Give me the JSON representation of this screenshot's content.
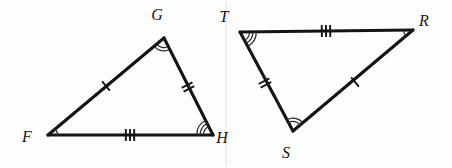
{
  "figure": {
    "kind": "congruent-triangles-diagram",
    "background_color": "#fdfdfd",
    "stroke_color": "#141414",
    "label_color": "#161616"
  },
  "triangles": [
    {
      "id": "triangle-fgh",
      "name": "FGH",
      "vertices": [
        {
          "id": "vertex-f",
          "label": "F",
          "x": 48,
          "y": 135,
          "label_x": 27,
          "label_y": 142,
          "angle_arcs": 1
        },
        {
          "id": "vertex-g",
          "label": "G",
          "x": 164,
          "y": 38,
          "label_x": 157,
          "label_y": 20,
          "angle_arcs": 2
        },
        {
          "id": "vertex-h",
          "label": "H",
          "x": 213,
          "y": 135,
          "label_x": 222,
          "label_y": 143,
          "angle_arcs": 3
        }
      ],
      "sides": [
        {
          "id": "side-fg",
          "from": "F",
          "to": "G",
          "ticks": 1,
          "tick_x": 106,
          "tick_y": 86
        },
        {
          "id": "side-gh",
          "from": "G",
          "to": "H",
          "ticks": 2,
          "tick_x": 188,
          "tick_y": 87
        },
        {
          "id": "side-fh",
          "from": "F",
          "to": "H",
          "ticks": 3,
          "tick_x": 130,
          "tick_y": 135
        }
      ]
    },
    {
      "id": "triangle-tsr",
      "name": "TSR",
      "vertices": [
        {
          "id": "vertex-t",
          "label": "T",
          "x": 240,
          "y": 32,
          "label_x": 224,
          "label_y": 22,
          "angle_arcs": 3
        },
        {
          "id": "vertex-r",
          "label": "R",
          "x": 413,
          "y": 30,
          "label_x": 424,
          "label_y": 26,
          "angle_arcs": 1
        },
        {
          "id": "vertex-s",
          "label": "S",
          "x": 293,
          "y": 131,
          "label_x": 286,
          "label_y": 158,
          "angle_arcs": 2
        }
      ],
      "sides": [
        {
          "id": "side-tr",
          "from": "T",
          "to": "R",
          "ticks": 3,
          "tick_x": 326,
          "tick_y": 31
        },
        {
          "id": "side-ts",
          "from": "T",
          "to": "S",
          "ticks": 2,
          "tick_x": 265,
          "tick_y": 83
        },
        {
          "id": "side-sr",
          "from": "S",
          "to": "R",
          "ticks": 1,
          "tick_x": 355,
          "tick_y": 82
        }
      ]
    }
  ],
  "correspondence": {
    "angle_single_arc": [
      "F",
      "R"
    ],
    "angle_double_arc": [
      "G",
      "S"
    ],
    "angle_triple_arc": [
      "H",
      "T"
    ],
    "side_single_tick": [
      "FG",
      "SR"
    ],
    "side_double_tick": [
      "GH",
      "TS"
    ],
    "side_triple_tick": [
      "FH",
      "TR"
    ]
  }
}
